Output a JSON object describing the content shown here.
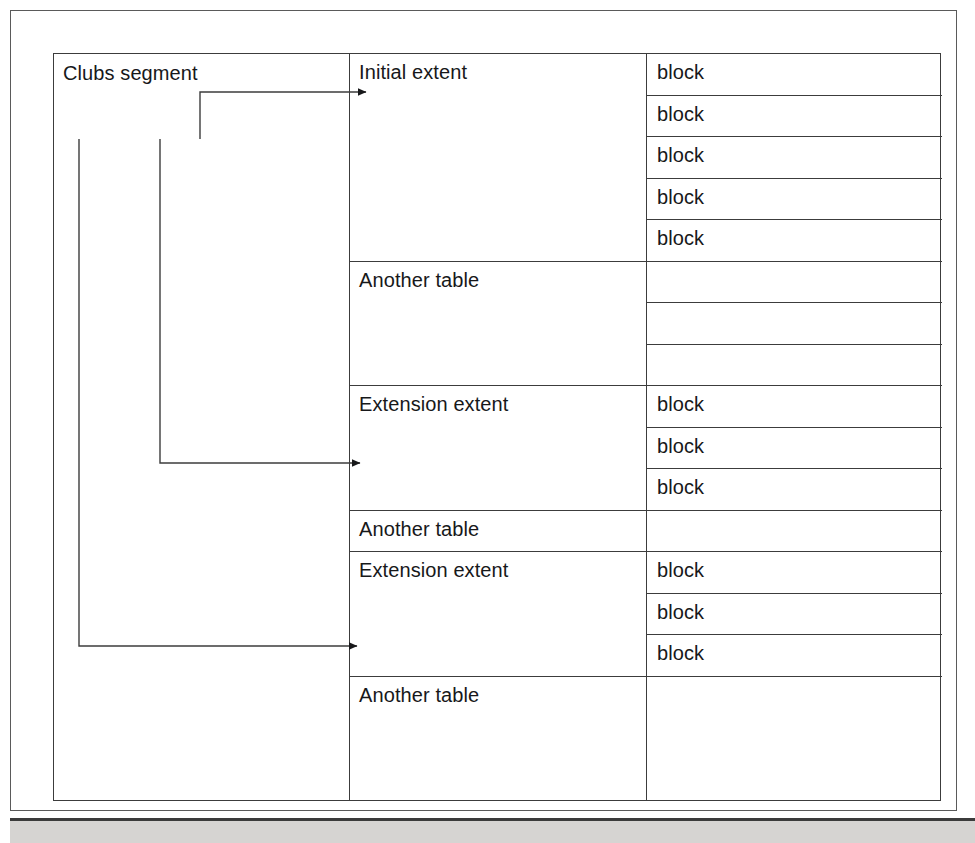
{
  "diagram": {
    "type": "segment-extent-block-structure",
    "segment": {
      "label": "Clubs segment"
    },
    "extents": [
      {
        "label": "Initial extent",
        "kind": "extent",
        "has_arrow": true,
        "blocks": [
          "block",
          "block",
          "block",
          "block",
          "block"
        ]
      },
      {
        "label": "Another table",
        "kind": "other-table",
        "has_arrow": false,
        "blocks": [
          "",
          "",
          ""
        ]
      },
      {
        "label": "Extension extent",
        "kind": "extent",
        "has_arrow": true,
        "blocks": [
          "block",
          "block",
          "block"
        ]
      },
      {
        "label": "Another table",
        "kind": "other-table",
        "has_arrow": false,
        "blocks": [
          ""
        ]
      },
      {
        "label": "Extension extent",
        "kind": "extent",
        "has_arrow": true,
        "blocks": [
          "block",
          "block",
          "block"
        ]
      },
      {
        "label": "Another table",
        "kind": "other-table",
        "has_arrow": false,
        "blocks": [
          ""
        ]
      }
    ],
    "colors": {
      "line": "#3c3c3c",
      "text": "#17181a",
      "page_background": "#ffffff",
      "bottom_band": "#d6d4d2"
    }
  }
}
